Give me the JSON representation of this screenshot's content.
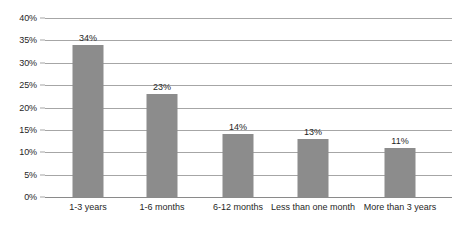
{
  "chart_data": {
    "type": "bar",
    "title": "",
    "subtitle": "",
    "xlabel": "",
    "ylabel": "",
    "categories": [
      "1-3 years",
      "1-6 months",
      "6-12 months",
      "Less than one month",
      "More than 3 years"
    ],
    "values": [
      34,
      23,
      14,
      13,
      11
    ],
    "data_labels": [
      "34%",
      "23%",
      "14%",
      "13%",
      "11%"
    ],
    "ylim": [
      0,
      40
    ],
    "ytick_values": [
      40,
      35,
      30,
      25,
      20,
      15,
      10,
      5,
      0
    ],
    "ytick_labels": [
      "40%",
      "35%",
      "30%",
      "25%",
      "20%",
      "15%",
      "10%",
      "5%",
      "0%"
    ],
    "grid": "horizontal",
    "legend": "none",
    "series": [
      {
        "name": "",
        "values": [
          34,
          23,
          14,
          13,
          11
        ]
      }
    ],
    "colors": {
      "bar": "#8c8c8c",
      "gridline": "#a6a6a6",
      "baseline": "#8a8a8a",
      "text": "#1f1f1f",
      "background": "#ffffff"
    }
  }
}
